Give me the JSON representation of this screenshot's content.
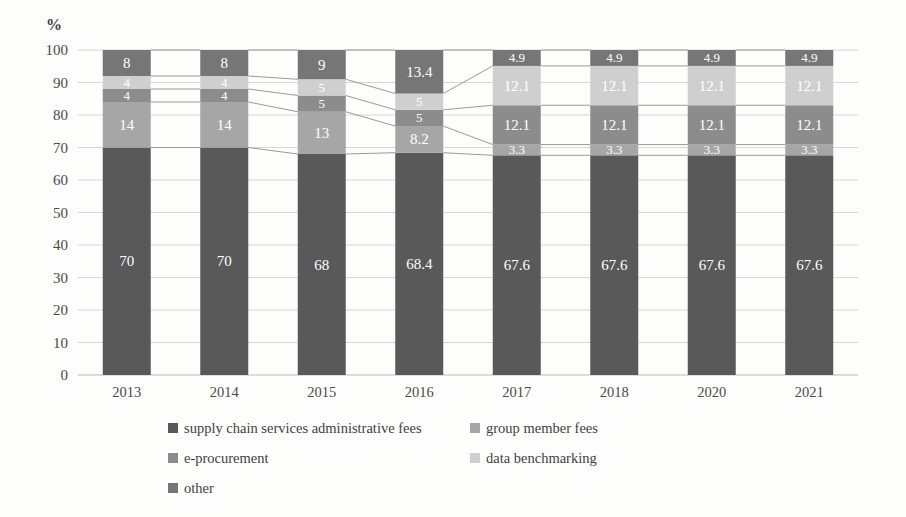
{
  "chart_data": {
    "type": "bar",
    "subtype": "stacked-bar-100",
    "title": "",
    "xlabel": "",
    "ylabel": "%",
    "ylim": [
      0,
      100
    ],
    "ytick_step": 10,
    "yticks": [
      "0",
      "10",
      "20",
      "30",
      "40",
      "50",
      "60",
      "70",
      "80",
      "90",
      "100"
    ],
    "grid": true,
    "legend_position": "bottom",
    "categories": [
      "2013",
      "2014",
      "2015",
      "2016",
      "2017",
      "2018",
      "2020",
      "2021"
    ],
    "series": [
      {
        "name": "supply chain services administrative fees",
        "color": "#595959",
        "values": [
          70,
          70,
          68,
          68.4,
          67.6,
          67.6,
          67.6,
          67.6
        ],
        "labels": [
          "70",
          "70",
          "68",
          "68.4",
          "67.6",
          "67.6",
          "67.6",
          "67.6"
        ]
      },
      {
        "name": "group member fees",
        "color": "#a6a6a6",
        "values": [
          14,
          14,
          13,
          8.2,
          3.3,
          3.3,
          3.3,
          3.3
        ],
        "labels": [
          "14",
          "14",
          "13",
          "8.2",
          "3.3",
          "3.3",
          "3.3",
          "3.3"
        ]
      },
      {
        "name": "e-procurement",
        "color": "#8c8c8c",
        "values": [
          4,
          4,
          5,
          5,
          12.1,
          12.1,
          12.1,
          12.1
        ],
        "labels": [
          "4",
          "4",
          "5",
          "5",
          "12.1",
          "12.1",
          "12.1",
          "12.1"
        ]
      },
      {
        "name": "data benchmarking",
        "color": "#cfcfcf",
        "values": [
          4,
          4,
          5,
          5,
          12.1,
          12.1,
          12.1,
          12.1
        ],
        "labels": [
          "4",
          "4",
          "5",
          "5",
          "12.1",
          "12.1",
          "12.1",
          "12.1"
        ]
      },
      {
        "name": "other",
        "color": "#767676",
        "values": [
          8,
          8,
          9,
          13.4,
          4.9,
          4.9,
          4.9,
          4.9
        ],
        "labels": [
          "8",
          "8",
          "9",
          "13.4",
          "4.9",
          "4.9",
          "4.9",
          "4.9"
        ]
      }
    ],
    "connector_lines": true,
    "legend": [
      {
        "label": "supply chain services administrative fees",
        "color": "#595959"
      },
      {
        "label": "group member fees",
        "color": "#a6a6a6"
      },
      {
        "label": "e-procurement",
        "color": "#8c8c8c"
      },
      {
        "label": "data benchmarking",
        "color": "#cfcfcf"
      },
      {
        "label": "other",
        "color": "#767676"
      }
    ]
  }
}
